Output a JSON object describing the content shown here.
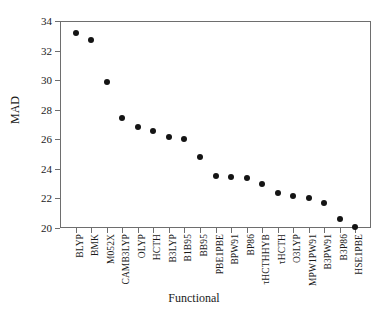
{
  "chart_data": {
    "type": "scatter",
    "title": "",
    "xlabel": "Functional",
    "ylabel": "MAD",
    "ylim": [
      20,
      34
    ],
    "yticks": [
      20,
      22,
      24,
      26,
      28,
      30,
      32,
      34
    ],
    "grid": false,
    "legend": "none",
    "marker": "filled-circle",
    "marker_color": "#141414",
    "categories": [
      "BLYP",
      "BMK",
      "M052X",
      "CAMB3LYP",
      "OLYP",
      "HCTH",
      "B3LYP",
      "B1B95",
      "BB95",
      "PBE1PBE",
      "BPW91",
      "BP86",
      "τHCTHHYB",
      "τHCTH",
      "O3LYP",
      "MPW1PW91",
      "B3PW91",
      "B3P86",
      "HSE1PBE"
    ],
    "values": [
      33.2,
      32.7,
      29.9,
      27.45,
      26.8,
      26.55,
      26.15,
      26.05,
      24.8,
      23.55,
      23.45,
      23.4,
      22.95,
      22.4,
      22.15,
      22.0,
      21.7,
      20.6,
      20.05
    ]
  },
  "axes": {
    "y_axis_title": "MAD",
    "x_axis_title": "Functional"
  }
}
